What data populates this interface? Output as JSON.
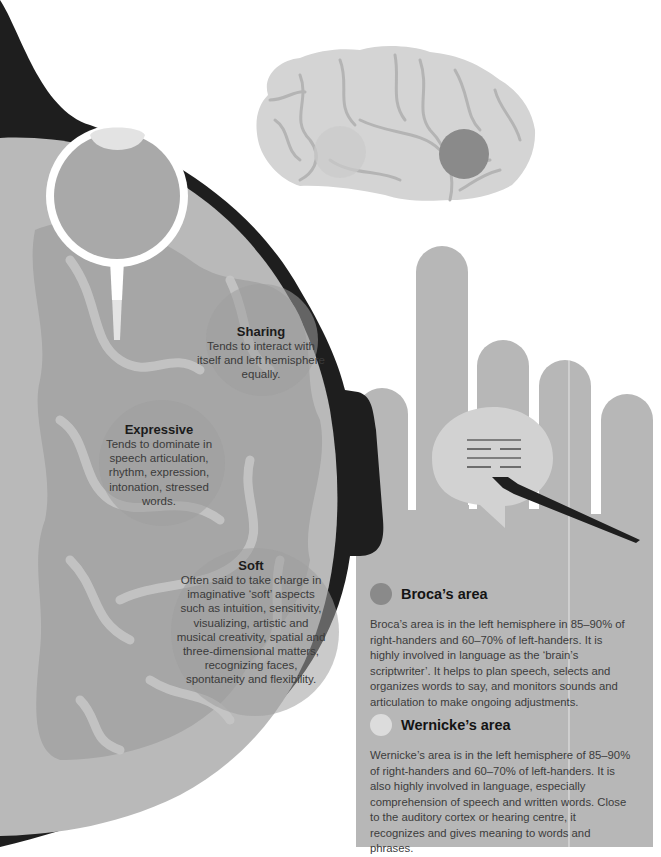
{
  "colors": {
    "background": "#ffffff",
    "head_outline": "#1e1e1e",
    "head_fill": "#b9b9b9",
    "brain_pattern": "#a6a6a6",
    "brain_sulci": "#cfcfcf",
    "bubble_overlay": "#9e9e9e",
    "side_brain_fill": "#d4d4d4",
    "side_brain_lines": "#b4b4b4",
    "broca_dot": "#8a8a8a",
    "wernicke_dot": "#dcdcdc",
    "hand_fill": "#b7b7b7",
    "speech_bubble": "#d2d2d2",
    "pen": "#1f1f1f"
  },
  "callouts": {
    "sharing": {
      "title": "Sharing",
      "text": "Tends to interact with itself and left hemisphere equally."
    },
    "expressive": {
      "title": "Expressive",
      "text": "Tends to dominate in speech articulation, rhythm, expression, intonation, stressed words."
    },
    "soft": {
      "title": "Soft",
      "text": "Often said to take charge in imaginative ‘soft’ aspects such as intuition, sensitivity, visualizing, artistic and musical creativity, spatial and three-dimensional matters, recognizing faces, spontaneity and flexibility."
    }
  },
  "areas": {
    "broca": {
      "name": "Broca’s area",
      "text": "Broca’s area is in the left hemisphere in 85–90% of right-handers and 60–70% of left-handers. It is highly involved in language as the ‘brain’s scriptwriter’. It helps to plan speech, selects and organizes words to say, and monitors sounds and articulation to make ongoing adjustments."
    },
    "wernicke": {
      "name": "Wernicke’s area",
      "text": "Wernicke’s area is in the left hemisphere of 85–90% of right-handers and 60–70% of left-handers. It is also highly involved in language, especially comprehension of speech and written words. Close to the auditory cortex or hearing centre, it recognizes and gives meaning to words and phrases."
    }
  },
  "icons": {
    "head": "head-cross-section-illustration",
    "eye": "eye-illustration",
    "side_brain": "brain-side-view-illustration",
    "hand": "hand-illustration",
    "speech_bubble": "speech-bubble-icon",
    "pen": "fountain-pen-icon"
  }
}
